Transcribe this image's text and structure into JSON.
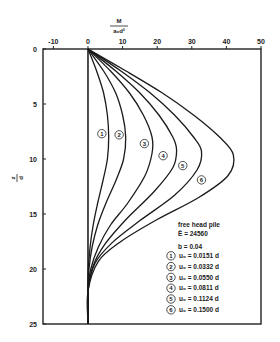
{
  "chart_data": {
    "type": "line",
    "title": "",
    "xlabel": "M / (a₀ d³)",
    "xlabel_num": "M",
    "xlabel_den": "a₀d³",
    "ylabel": "z / d",
    "ylabel_num": "z",
    "ylabel_den": "d",
    "xlim": [
      -13,
      50
    ],
    "ylim": [
      0,
      25
    ],
    "y_inverted": true,
    "x_axis_position": "top",
    "x_ticks": [
      -10,
      0,
      10,
      20,
      30,
      40,
      50
    ],
    "y_ticks": [
      0,
      5,
      10,
      15,
      20,
      25
    ],
    "grid": false,
    "legend": {
      "position": "lower right",
      "title": "free head pile",
      "params": [
        "Ē = 24560",
        "b = 0.04"
      ],
      "entries": [
        {
          "marker": "1",
          "label": "u₀ = 0.0151 d"
        },
        {
          "marker": "2",
          "label": "u₀ = 0.0332 d"
        },
        {
          "marker": "3",
          "label": "u₀ = 0.0550 d"
        },
        {
          "marker": "4",
          "label": "u₀ = 0.0811 d"
        },
        {
          "marker": "5",
          "label": "u₀ = 0.1124 d"
        },
        {
          "marker": "6",
          "label": "u₀ = 0.1500 d"
        }
      ]
    },
    "series": [
      {
        "name": "1",
        "u0": "0.0151 d",
        "peak_x": 6,
        "peak_z": 8.0,
        "points": [
          [
            0,
            0
          ],
          [
            2.5,
            2
          ],
          [
            4.5,
            4
          ],
          [
            5.6,
            6
          ],
          [
            6,
            8
          ],
          [
            5.6,
            10
          ],
          [
            4.3,
            12
          ],
          [
            2.8,
            14
          ],
          [
            1.5,
            16
          ],
          [
            0.6,
            18
          ],
          [
            0.1,
            20
          ],
          [
            0,
            22
          ],
          [
            0,
            25
          ]
        ]
      },
      {
        "name": "2",
        "u0": "0.0332 d",
        "peak_x": 11,
        "peak_z": 8.3,
        "points": [
          [
            0,
            0
          ],
          [
            4.5,
            2
          ],
          [
            8,
            4
          ],
          [
            10,
            6
          ],
          [
            10.9,
            8
          ],
          [
            10.3,
            10
          ],
          [
            8,
            12
          ],
          [
            5.2,
            14
          ],
          [
            2.8,
            16
          ],
          [
            1.2,
            18
          ],
          [
            0.3,
            20
          ],
          [
            0,
            22
          ],
          [
            0,
            25
          ]
        ]
      },
      {
        "name": "3",
        "u0": "0.0550 d",
        "peak_x": 19,
        "peak_z": 8.8,
        "points": [
          [
            0,
            0
          ],
          [
            6.5,
            2
          ],
          [
            12,
            4
          ],
          [
            16,
            6
          ],
          [
            18.5,
            8
          ],
          [
            18.5,
            9.5
          ],
          [
            16.5,
            11.5
          ],
          [
            11.5,
            14
          ],
          [
            6.5,
            16
          ],
          [
            3,
            18
          ],
          [
            0.8,
            20
          ],
          [
            0,
            22
          ],
          [
            0,
            25
          ]
        ]
      },
      {
        "name": "4",
        "u0": "0.0811 d",
        "peak_x": 26,
        "peak_z": 9.0,
        "points": [
          [
            0,
            0
          ],
          [
            8,
            2
          ],
          [
            15,
            4
          ],
          [
            20.5,
            6
          ],
          [
            24.5,
            8
          ],
          [
            25.6,
            9.2
          ],
          [
            24.5,
            10.8
          ],
          [
            19,
            13
          ],
          [
            11,
            15.5
          ],
          [
            5,
            17.7
          ],
          [
            1.5,
            19.7
          ],
          [
            0,
            22
          ],
          [
            0,
            25
          ]
        ]
      },
      {
        "name": "5",
        "u0": "0.1124 d",
        "peak_x": 33,
        "peak_z": 9.3,
        "points": [
          [
            0,
            0
          ],
          [
            9.5,
            2
          ],
          [
            18,
            4
          ],
          [
            25,
            6
          ],
          [
            30.5,
            8
          ],
          [
            32.8,
            9.3
          ],
          [
            31.5,
            11
          ],
          [
            25,
            13.3
          ],
          [
            15,
            15.6
          ],
          [
            7,
            17.6
          ],
          [
            2,
            19.5
          ],
          [
            0,
            22
          ],
          [
            0,
            25
          ]
        ]
      },
      {
        "name": "6",
        "u0": "0.1500 d",
        "peak_x": 42,
        "peak_z": 9.6,
        "points": [
          [
            0,
            0
          ],
          [
            11,
            2
          ],
          [
            21.5,
            4
          ],
          [
            30.5,
            6
          ],
          [
            38,
            8
          ],
          [
            42,
            9.6
          ],
          [
            40.5,
            11.5
          ],
          [
            32,
            13.5
          ],
          [
            20,
            15.5
          ],
          [
            9.5,
            17.5
          ],
          [
            3,
            19.3
          ],
          [
            0,
            22
          ],
          [
            0,
            25
          ]
        ]
      }
    ],
    "series_labels": [
      {
        "name": "1",
        "x": 4,
        "z": 7.7
      },
      {
        "name": "2",
        "x": 9,
        "z": 7.8
      },
      {
        "name": "3",
        "x": 16.3,
        "z": 8.6
      },
      {
        "name": "4",
        "x": 21.7,
        "z": 9.7
      },
      {
        "name": "5",
        "x": 27.4,
        "z": 10.6
      },
      {
        "name": "6",
        "x": 32.8,
        "z": 11.9
      }
    ]
  }
}
